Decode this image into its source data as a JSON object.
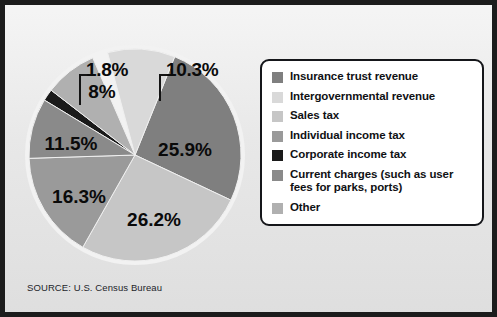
{
  "figure": {
    "source_note": "SOURCE: U.S. Census Bureau",
    "background_color": "#e8e8e8",
    "frame_color": "#1c1c1c"
  },
  "legend": {
    "box_border_color": "#15161a",
    "box_background": "#ffffff",
    "items": [
      {
        "label": "Insurance trust revenue",
        "color": "#7f7f7f"
      },
      {
        "label": "Intergovernmental revenue",
        "color": "#d9d9d9"
      },
      {
        "label": "Sales tax",
        "color": "#c6c6c6"
      },
      {
        "label": "Individual income tax",
        "color": "#9a9a9a"
      },
      {
        "label": "Corporate income tax",
        "color": "#1a1a1a"
      },
      {
        "label": "Current charges (such as user fees for parks, ports)",
        "color": "#8a8a8a"
      },
      {
        "label": "Other",
        "color": "#b0b0b0"
      }
    ]
  },
  "chart_data": {
    "type": "pie",
    "title": "",
    "source": "SOURCE: U.S. Census Bureau",
    "labels": [
      "Insurance trust revenue",
      "Intergovernmental revenue",
      "Sales tax",
      "Individual income tax",
      "Corporate income tax",
      "Current charges (such as user fees for parks, ports)",
      "Other"
    ],
    "values": [
      25.9,
      10.3,
      26.2,
      16.3,
      1.8,
      11.5,
      8
    ],
    "value_labels": [
      "25.9%",
      "10.3%",
      "26.2%",
      "16.3%",
      "1.8%",
      "11.5%",
      "8%"
    ],
    "colors": [
      "#7f7f7f",
      "#d9d9d9",
      "#c6c6c6",
      "#9a9a9a",
      "#1a1a1a",
      "#8a8a8a",
      "#b0b0b0"
    ],
    "units": "percent",
    "slices": [
      {
        "label": "Insurance trust revenue",
        "value": 25.9,
        "value_label": "25.9%",
        "color": "#7f7f7f",
        "start_angle": 22,
        "end_angle": 115.2,
        "label_x": 162,
        "label_y": 113,
        "callout": false
      },
      {
        "label": "Intergovernmental revenue",
        "value": 10.3,
        "value_label": "10.3%",
        "color": "#d9d9d9",
        "start_angle": 345,
        "end_angle": 22,
        "label_x": 0,
        "label_y": 0,
        "callout": true
      },
      {
        "label": "Sales tax",
        "value": 26.2,
        "value_label": "26.2%",
        "color": "#c6c6c6",
        "start_angle": 115.2,
        "end_angle": 209.5,
        "label_x": 131,
        "label_y": 183,
        "callout": false
      },
      {
        "label": "Individual income tax",
        "value": 16.3,
        "value_label": "16.3%",
        "color": "#9a9a9a",
        "start_angle": 209.5,
        "end_angle": 268.2,
        "label_x": 56,
        "label_y": 160,
        "callout": false
      },
      {
        "label": "Corporate income tax",
        "value": 1.8,
        "value_label": "1.8%",
        "color": "#1a1a1a",
        "start_angle": 301.2,
        "end_angle": 307.7,
        "label_x": 0,
        "label_y": 0,
        "callout": true
      },
      {
        "label": "Current charges (such as user fees for parks, ports)",
        "value": 11.5,
        "value_label": "11.5%",
        "color": "#8a8a8a",
        "start_angle": 268.2,
        "end_angle": 301.2,
        "label_x": 48,
        "label_y": 107,
        "callout": false
      },
      {
        "label": "Other",
        "value": 8,
        "value_label": "8%",
        "color": "#b0b0b0",
        "start_angle": 307.7,
        "end_angle": 336.5,
        "label_x": 79,
        "label_y": 55,
        "callout": false
      }
    ],
    "callouts": [
      {
        "value_label": "1.8%",
        "for": "Corporate income tax"
      },
      {
        "value_label": "10.3%",
        "for": "Intergovernmental revenue"
      }
    ]
  }
}
